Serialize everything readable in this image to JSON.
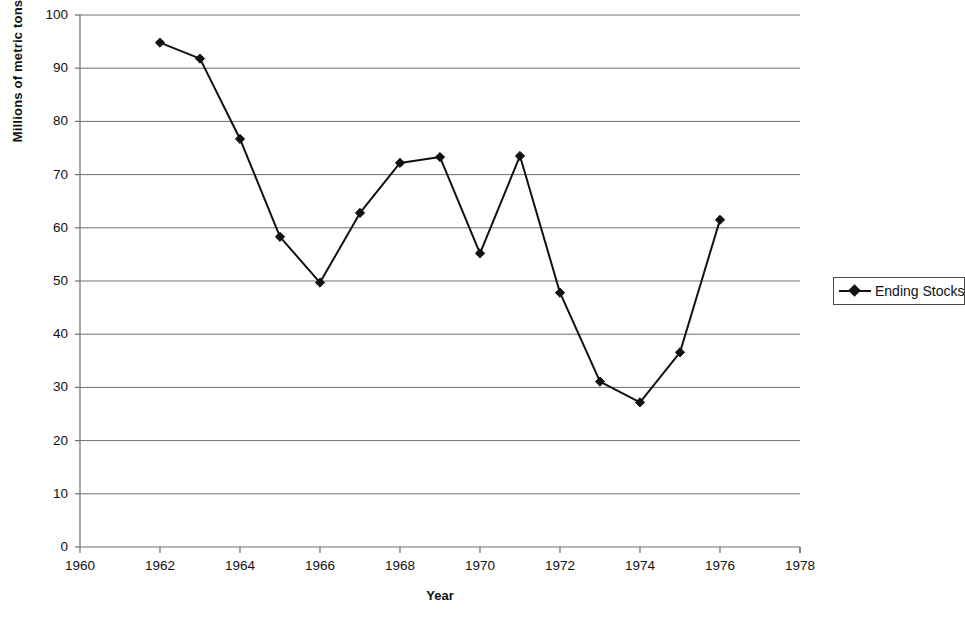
{
  "chart_data": {
    "type": "line",
    "title": "",
    "xlabel": "Year",
    "ylabel": "Millions of metric tons",
    "xlim": [
      1960,
      1978
    ],
    "ylim": [
      0,
      100
    ],
    "xticks": [
      1960,
      1962,
      1964,
      1966,
      1968,
      1970,
      1972,
      1974,
      1976,
      1978
    ],
    "yticks": [
      0,
      10,
      20,
      30,
      40,
      50,
      60,
      70,
      80,
      90,
      100
    ],
    "grid": "horizontal",
    "legend_position": "right",
    "marker": "diamond",
    "line_color": "#111111",
    "series": [
      {
        "name": "Ending Stocks",
        "x": [
          1962,
          1963,
          1964,
          1965,
          1966,
          1967,
          1968,
          1969,
          1970,
          1971,
          1972,
          1973,
          1974,
          1975,
          1976
        ],
        "values": [
          94.8,
          91.8,
          76.7,
          58.3,
          49.7,
          62.8,
          72.2,
          73.3,
          55.2,
          73.5,
          47.8,
          31.1,
          27.2,
          36.6,
          61.5
        ]
      }
    ]
  },
  "axes": {
    "y_title": "Millions of metric tons",
    "x_title": "Year",
    "y_tick_labels": [
      "100",
      "90",
      "80",
      "70",
      "60",
      "50",
      "40",
      "30",
      "20",
      "10",
      "0"
    ],
    "x_tick_labels": [
      "1960",
      "1962",
      "1964",
      "1966",
      "1968",
      "1970",
      "1972",
      "1974",
      "1976",
      "1978"
    ]
  },
  "legend": {
    "entries": [
      {
        "label": "Ending Stocks",
        "marker": "diamond-marker",
        "color": "#111111"
      }
    ]
  }
}
